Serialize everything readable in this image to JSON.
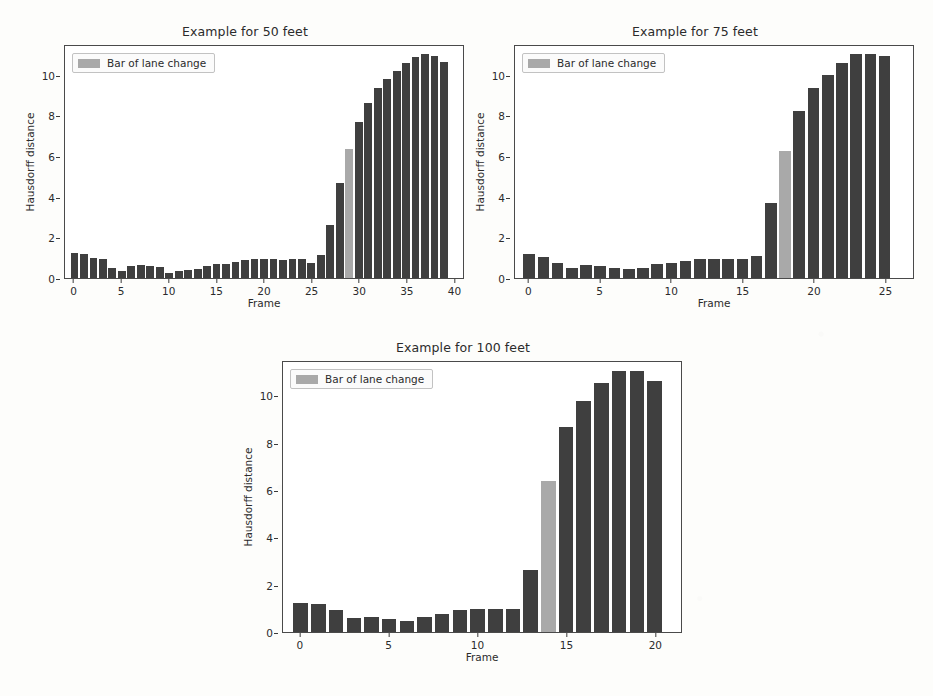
{
  "figure": {
    "background": "#fdfdfb",
    "bar_color": "#3f3f3f",
    "lane_change_color": "#a9a9a9"
  },
  "panels": [
    {
      "id": "panel-50",
      "title": "Example for 50 feet",
      "legend_label": "Bar of lane change",
      "xlabel": "Frame",
      "ylabel": "Hausdorff distance"
    },
    {
      "id": "panel-75",
      "title": "Example for 75 feet",
      "legend_label": "Bar of lane change",
      "xlabel": "Frame",
      "ylabel": "Hausdorff distance"
    },
    {
      "id": "panel-100",
      "title": "Example for 100 feet",
      "legend_label": "Bar of lane change",
      "xlabel": "Frame",
      "ylabel": "Hausdorff distance"
    }
  ],
  "chart_data": [
    {
      "type": "bar",
      "title": "Example for 50 feet",
      "xlabel": "Frame",
      "ylabel": "Hausdorff distance",
      "xlim": [
        -1,
        41
      ],
      "ylim": [
        0,
        11.5
      ],
      "yticks": [
        0,
        2,
        4,
        6,
        8,
        10
      ],
      "xticks": [
        0,
        5,
        10,
        15,
        20,
        25,
        30,
        35,
        40
      ],
      "grid": false,
      "legend": {
        "position": "upper left",
        "entries": [
          "Bar of lane change"
        ]
      },
      "lane_change_frame": 29,
      "categories": [
        0,
        1,
        2,
        3,
        4,
        5,
        6,
        7,
        8,
        9,
        10,
        11,
        12,
        13,
        14,
        15,
        16,
        17,
        18,
        19,
        20,
        21,
        22,
        23,
        24,
        25,
        26,
        27,
        28,
        29,
        30,
        31,
        32,
        33,
        34,
        35,
        36,
        37,
        38,
        39
      ],
      "values": [
        1.22,
        1.2,
        1.0,
        0.92,
        0.5,
        0.34,
        0.6,
        0.64,
        0.58,
        0.55,
        0.27,
        0.37,
        0.42,
        0.47,
        0.62,
        0.68,
        0.7,
        0.79,
        0.88,
        0.92,
        0.93,
        0.93,
        0.91,
        0.92,
        0.92,
        0.76,
        1.12,
        2.62,
        4.72,
        6.4,
        7.72,
        8.69,
        9.41,
        9.86,
        10.28,
        10.65,
        10.97,
        11.11,
        11.01,
        10.7
      ]
    },
    {
      "type": "bar",
      "title": "Example for 75 feet",
      "xlabel": "Frame",
      "ylabel": "Hausdorff distance",
      "xlim": [
        -1,
        27
      ],
      "ylim": [
        0,
        11.5
      ],
      "yticks": [
        0,
        2,
        4,
        6,
        8,
        10
      ],
      "xticks": [
        0,
        5,
        10,
        15,
        20,
        25
      ],
      "grid": false,
      "legend": {
        "position": "upper left",
        "entries": [
          "Bar of lane change"
        ]
      },
      "lane_change_frame": 18,
      "categories": [
        0,
        1,
        2,
        3,
        4,
        5,
        6,
        7,
        8,
        9,
        10,
        11,
        12,
        13,
        14,
        15,
        16,
        17,
        18,
        19,
        20,
        21,
        22,
        23,
        24,
        25
      ],
      "values": [
        1.2,
        1.05,
        0.75,
        0.52,
        0.66,
        0.6,
        0.5,
        0.45,
        0.5,
        0.7,
        0.76,
        0.86,
        0.96,
        0.95,
        0.94,
        0.94,
        1.1,
        3.72,
        6.28,
        8.28,
        9.4,
        10.05,
        10.65,
        11.1,
        11.1,
        11.0
      ]
    },
    {
      "type": "bar",
      "title": "Example for 100 feet",
      "xlabel": "Frame",
      "ylabel": "Hausdorff distance",
      "xlim": [
        -1,
        21.5
      ],
      "ylim": [
        0,
        11.5
      ],
      "yticks": [
        0,
        2,
        4,
        6,
        8,
        10
      ],
      "xticks": [
        0,
        5,
        10,
        15,
        20
      ],
      "grid": false,
      "legend": {
        "position": "upper left",
        "entries": [
          "Bar of lane change"
        ]
      },
      "lane_change_frame": 14,
      "categories": [
        0,
        1,
        2,
        3,
        4,
        5,
        6,
        7,
        8,
        9,
        10,
        11,
        12,
        13,
        14,
        15,
        16,
        17,
        18,
        19,
        20
      ],
      "values": [
        1.22,
        1.21,
        0.95,
        0.6,
        0.65,
        0.55,
        0.45,
        0.63,
        0.76,
        0.92,
        0.97,
        0.96,
        0.97,
        2.63,
        6.42,
        8.72,
        9.85,
        10.62,
        11.1,
        11.1,
        10.68
      ]
    }
  ]
}
